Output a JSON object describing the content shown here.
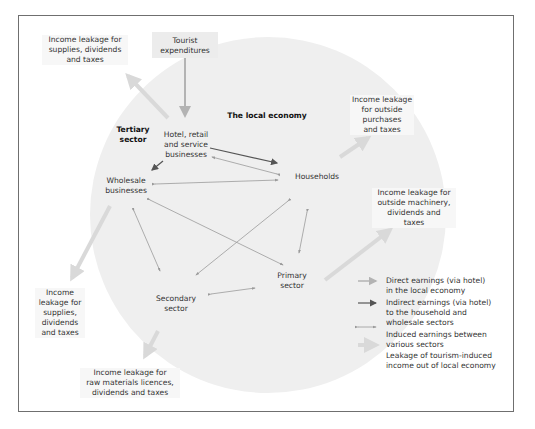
{
  "diagram": {
    "title": "The local economy",
    "colors": {
      "circle_fill": "#efefef",
      "direct_arrow": "#b3b3b3",
      "indirect_arrow": "#555555",
      "induced_arrow": "#9a9a9a",
      "leakage_arrow": "#d9d9d9",
      "frame_border": "#6f6f6f"
    },
    "source": {
      "label": "Tourist\nexpenditures"
    },
    "sectors": {
      "tertiary": "Tertiary\nsector",
      "hotel": "Hotel, retail\nand service\nbusinesses",
      "wholesale": "Wholesale\nbusinesses",
      "households": "Households",
      "secondary": "Secondary\nsector",
      "primary": "Primary\nsector"
    },
    "leakages": {
      "hotel_top": "Income leakage for\nsupplies, dividends\nand taxes",
      "households": "Income leakage\nfor outside\npurchases\nand taxes",
      "primary": "Income leakage for\noutside machinery,\ndividends and\ntaxes",
      "wholesale": "Income\nleakage for\nsupplies,\ndividends\nand taxes",
      "secondary": "Income leakage for\nraw materials licences,\ndividends and taxes"
    },
    "legend": [
      {
        "type": "direct",
        "label": "Direct earnings (via hotel)\nin the local economy"
      },
      {
        "type": "indirect",
        "label": "Indirect earnings (via hotel)\nto the household and\nwholesale sectors"
      },
      {
        "type": "induced",
        "label": "Induced earnings between\nvarious sectors"
      },
      {
        "type": "leakage",
        "label": "Leakage of tourism-induced\nincome out of local economy"
      }
    ]
  }
}
